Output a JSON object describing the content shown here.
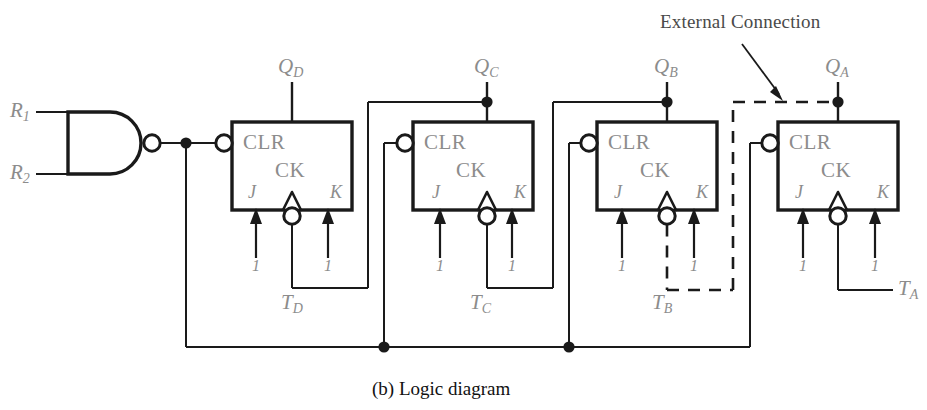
{
  "figure": {
    "caption": "(b)  Logic diagram",
    "annotation": "External Connection",
    "colors": {
      "wire": "#1a1a1a",
      "label": "#8c8c8c",
      "caption": "#111111",
      "background": "#ffffff"
    }
  },
  "gate": {
    "type": "NAND",
    "inputs": [
      {
        "name": "R1",
        "base": "R",
        "sub": "1"
      },
      {
        "name": "R2",
        "base": "R",
        "sub": "2"
      }
    ]
  },
  "flipflops": [
    {
      "id": "D",
      "output": {
        "base": "Q",
        "sub": "D"
      },
      "clock": {
        "base": "T",
        "sub": "D"
      },
      "clear_label": "CLR",
      "clock_label": "CK",
      "j_label": "J",
      "k_label": "K",
      "j_value": "1",
      "k_value": "1"
    },
    {
      "id": "C",
      "output": {
        "base": "Q",
        "sub": "C"
      },
      "clock": {
        "base": "T",
        "sub": "C"
      },
      "clear_label": "CLR",
      "clock_label": "CK",
      "j_label": "J",
      "k_label": "K",
      "j_value": "1",
      "k_value": "1"
    },
    {
      "id": "B",
      "output": {
        "base": "Q",
        "sub": "B"
      },
      "clock": {
        "base": "T",
        "sub": "B"
      },
      "clear_label": "CLR",
      "clock_label": "CK",
      "j_label": "J",
      "k_label": "K",
      "j_value": "1",
      "k_value": "1"
    },
    {
      "id": "A",
      "output": {
        "base": "Q",
        "sub": "A"
      },
      "clock": {
        "base": "T",
        "sub": "A"
      },
      "clear_label": "CLR",
      "clock_label": "CK",
      "j_label": "J",
      "k_label": "K",
      "j_value": "1",
      "k_value": "1"
    }
  ]
}
